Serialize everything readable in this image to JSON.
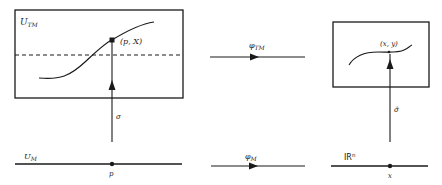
{
  "diagram": {
    "colors": {
      "ink": "#1a1a1a",
      "background": "#ffffff"
    },
    "top_left": {
      "box_label": "U",
      "box_label_sub": "TM",
      "point_label": "(p, X)",
      "section_arrow_label": "σ"
    },
    "top_middle": {
      "map_label": "φ",
      "map_label_sub": "TM"
    },
    "top_right": {
      "point_label": "(x, y)",
      "section_arrow_label": "σ̂"
    },
    "bottom_left": {
      "line_label": "U",
      "line_label_sub": "M",
      "point_label": "p"
    },
    "bottom_middle": {
      "map_label": "φ",
      "map_label_sub": "M"
    },
    "bottom_right": {
      "line_label": "IR",
      "line_label_sup": "n",
      "point_label": "x"
    }
  }
}
